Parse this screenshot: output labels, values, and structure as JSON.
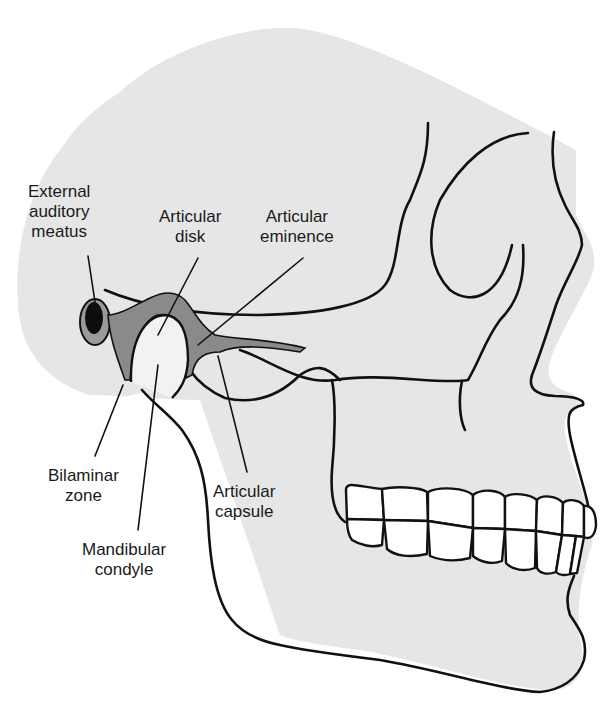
{
  "figure": {
    "colors": {
      "background": "#ffffff",
      "skull_fill": "#e6e6e6",
      "outline": "#111111",
      "disk": "#8a8a8a",
      "meatus_dark": "#0d0d0d",
      "meatus_ring": "#9a9a9a"
    }
  },
  "labels": {
    "external_auditory_meatus": {
      "line1": "External",
      "line2": "auditory",
      "line3": "meatus"
    },
    "articular_disk": {
      "line1": "Articular",
      "line2": "disk"
    },
    "articular_eminence": {
      "line1": "Articular",
      "line2": "eminence"
    },
    "bilaminar_zone": {
      "line1": "Bilaminar",
      "line2": "zone"
    },
    "articular_capsule": {
      "line1": "Articular",
      "line2": "capsule"
    },
    "mandibular_condyle": {
      "line1": "Mandibular",
      "line2": "condyle"
    }
  }
}
